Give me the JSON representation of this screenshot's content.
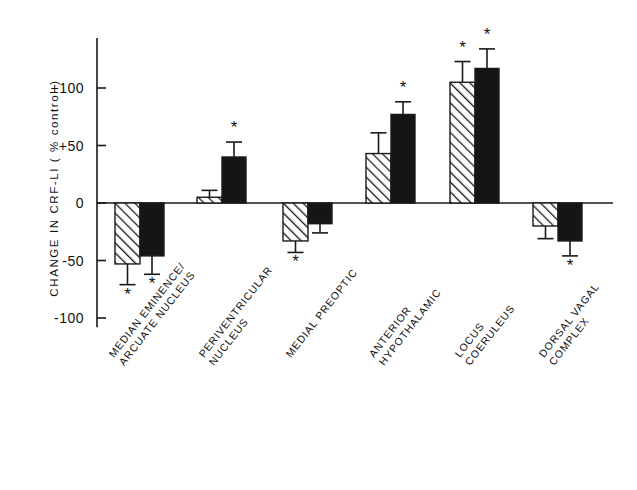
{
  "chart_data": {
    "type": "bar",
    "title": "",
    "subtitle": "",
    "xlabel": "",
    "ylabel": "CHANGE IN CRF-LI ( % control )",
    "ylim": [
      -120,
      140
    ],
    "yticks": [
      100,
      50,
      0,
      -50,
      -100
    ],
    "ytick_labels": [
      "+100",
      "+50",
      "0",
      "-50",
      "-100"
    ],
    "grid": false,
    "legend": "none",
    "zero_line": true,
    "significance_marker": "*",
    "categories": [
      "MEDIAN EMINENCE/ ARCUATE NUCLEUS",
      "PERIVENTRICULAR NUCLEUS",
      "MEDIAL PREOPTIC",
      "ANTERIOR HYPOTHALAMIC",
      "LOCUS COERULEUS",
      "DORSAL VAGAL COMPLEX"
    ],
    "category_lines": [
      [
        "MEDIAN EMINENCE/",
        "ARCUATE NUCLEUS"
      ],
      [
        "PERIVENTRICULAR",
        "NUCLEUS"
      ],
      [
        "MEDIAL PREOPTIC"
      ],
      [
        "ANTERIOR",
        "HYPOTHALAMIC"
      ],
      [
        "LOCUS",
        "COERULEUS"
      ],
      [
        "DORSAL VAGAL",
        "COMPLEX"
      ]
    ],
    "series": [
      {
        "name": "hatched",
        "fill": "hatched",
        "color": "#ffffff",
        "values": [
          -53,
          5,
          -33,
          43,
          105,
          -20
        ],
        "errors": [
          18,
          6,
          10,
          18,
          18,
          11
        ],
        "significant": [
          true,
          false,
          true,
          false,
          true,
          false
        ]
      },
      {
        "name": "solid",
        "fill": "solid",
        "color": "#151515",
        "values": [
          -46,
          40,
          -18,
          77,
          117,
          -33
        ],
        "errors": [
          16,
          13,
          8,
          11,
          17,
          13
        ],
        "significant": [
          true,
          true,
          false,
          true,
          true,
          true
        ]
      }
    ]
  }
}
